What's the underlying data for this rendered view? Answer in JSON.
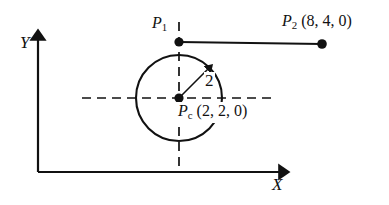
{
  "figure": {
    "background_color": "#ffffff",
    "stroke_color": "#111111",
    "axes": {
      "y_label": "Y",
      "x_label": "X"
    },
    "points": [
      {
        "id": "p1",
        "label_main": "P",
        "label_sub": "1",
        "label_coords": "",
        "x": 179,
        "y": 42
      },
      {
        "id": "p2",
        "label_main": "P",
        "label_sub": "2",
        "label_coords": " (8, 4, 0)",
        "x": 322,
        "y": 44
      },
      {
        "id": "pc",
        "label_main": "P",
        "label_sub": "c",
        "label_coords": " (2, 2, 0)",
        "x": 179,
        "y": 98
      }
    ],
    "circle": {
      "center_x": 179,
      "center_y": 98,
      "radius_px": 43,
      "radius_label": "2"
    }
  }
}
